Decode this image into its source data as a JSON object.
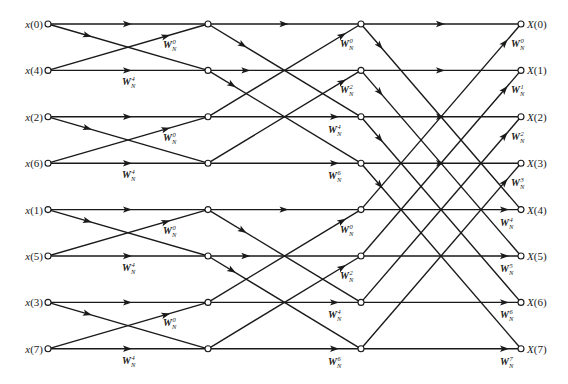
{
  "diagram": {
    "type": "fft-butterfly-decimation-in-time",
    "points": 8,
    "inputs": [
      "x(0)",
      "x(4)",
      "x(2)",
      "x(6)",
      "x(1)",
      "x(5)",
      "x(3)",
      "x(7)"
    ],
    "outputs": [
      "X(0)",
      "X(1)",
      "X(2)",
      "X(3)",
      "X(4)",
      "X(5)",
      "X(6)",
      "X(7)"
    ],
    "twiddle_base": "W",
    "twiddle_sub": "N",
    "stages": [
      {
        "name": "stage-1",
        "span": 1,
        "twiddles": [
          0,
          4,
          0,
          4,
          0,
          4,
          0,
          4
        ]
      },
      {
        "name": "stage-2",
        "span": 2,
        "twiddles": [
          0,
          2,
          4,
          6,
          0,
          2,
          4,
          6
        ]
      },
      {
        "name": "stage-3",
        "span": 4,
        "twiddles": [
          0,
          1,
          2,
          3,
          4,
          5,
          6,
          7
        ]
      }
    ]
  }
}
